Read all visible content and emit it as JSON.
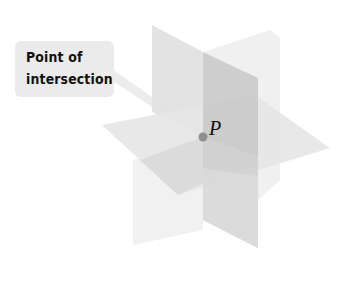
{
  "figure": {
    "callout_label": "Point of\nintersection",
    "point_label": "P"
  },
  "colors": {
    "background": "#ffffff",
    "callout_box": "#ebebeb",
    "plane_light": "#e4e4e4",
    "plane_mid": "#d6d6d6",
    "plane_dark": "#c4c4c4",
    "point": "#8f8f8f",
    "text": "#111111"
  }
}
